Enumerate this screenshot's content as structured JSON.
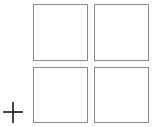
{
  "grid": {
    "border_color": "#8a8a8a",
    "tiles": [
      {
        "id": "tile-1",
        "row": 1,
        "col": 1,
        "x": 33,
        "y": 4,
        "w": 55,
        "h": 57
      },
      {
        "id": "tile-2",
        "row": 1,
        "col": 2,
        "x": 94,
        "y": 4,
        "w": 55,
        "h": 57
      },
      {
        "id": "tile-3",
        "row": 2,
        "col": 1,
        "x": 33,
        "y": 67,
        "w": 55,
        "h": 56
      },
      {
        "id": "tile-4",
        "row": 2,
        "col": 2,
        "x": 94,
        "y": 67,
        "w": 55,
        "h": 56
      }
    ]
  },
  "add_button": {
    "icon": "plus-icon",
    "color": "#1a1a1a"
  }
}
